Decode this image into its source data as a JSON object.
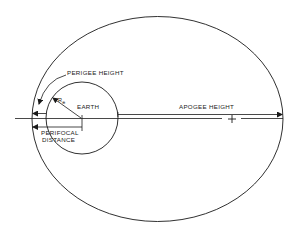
{
  "diagram": {
    "labels": {
      "perigee_height": "PERIGEE HEIGHT",
      "earth": "EARTH",
      "earth_radius": "R",
      "earth_radius_sub": "⊕",
      "apogee_height": "APOGEE HEIGHT",
      "perifocal_line1": "PERIFOCAL",
      "perifocal_line2": "DISTANCE"
    },
    "colors": {
      "ink": "#1a1a1a",
      "background": "#ffffff"
    }
  }
}
